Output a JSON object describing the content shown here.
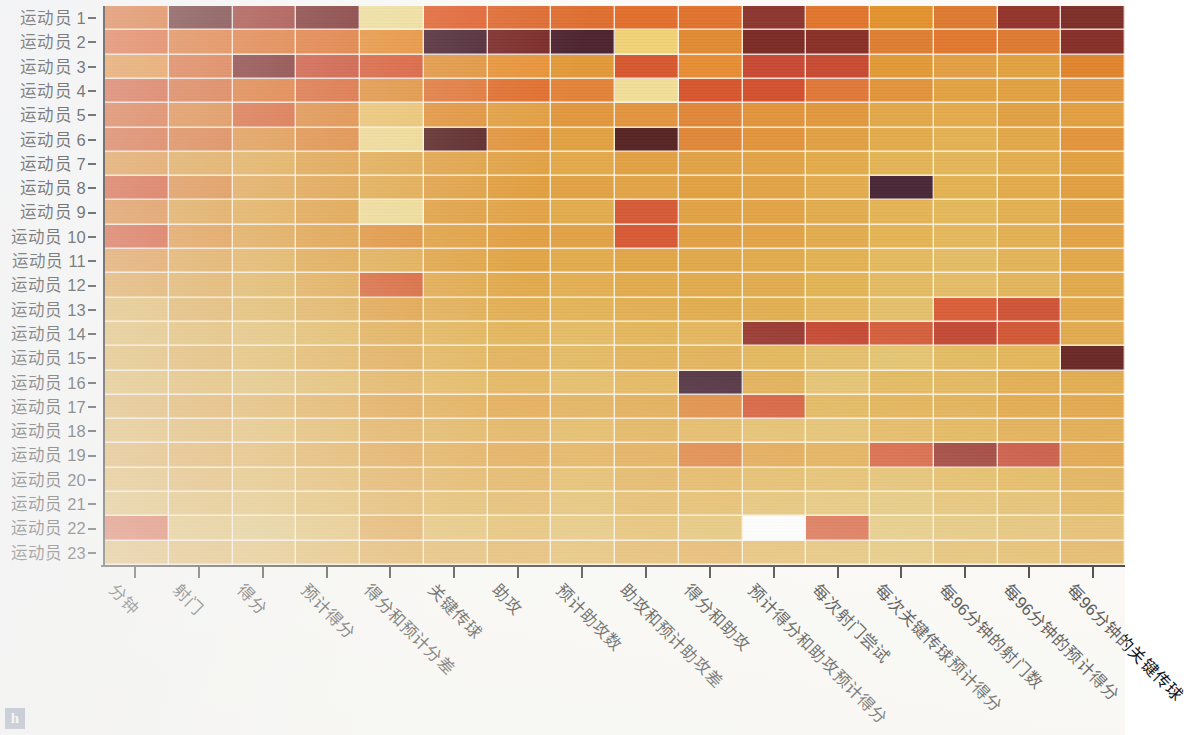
{
  "figure": {
    "panel_label": "h",
    "panel_badge_color": "#3b4a78",
    "background_color": "#fbfaf8",
    "gridline_color": "#fffcf4"
  },
  "chart_data": {
    "type": "heatmap",
    "title": "",
    "xlabel": "",
    "ylabel": "",
    "grid": true,
    "legend": "none",
    "colormap": {
      "name": "YlOrRd-reversed-ish",
      "stops": [
        "#ffffff",
        "#f4e3a0",
        "#eecb72",
        "#e8a84a",
        "#e2923c",
        "#dd7a34",
        "#d95f30",
        "#cf4f36",
        "#b8443a",
        "#8e3530",
        "#6b2a28",
        "#4a2838"
      ],
      "low_label": "low",
      "high_label": "high"
    },
    "categories": [
      "分钟",
      "射门",
      "得分",
      "预计得分",
      "得分和预计分差",
      "关键传球",
      "助攻",
      "预计助攻数",
      "助攻和预计助攻差",
      "得分和助攻",
      "预计得分和助攻预计得分",
      "每次射门尝试",
      "每次关键传球预计得分",
      "每96分钟的射门数",
      "每96分钟的预计得分",
      "每96分钟的关键传球"
    ],
    "rows": [
      "运动员 1",
      "运动员 2",
      "运动员 3",
      "运动员 4",
      "运动员 5",
      "运动员 6",
      "运动员 7",
      "运动员 8",
      "运动员 9",
      "运动员 10",
      "运动员 11",
      "运动员 12",
      "运动员 13",
      "运动员 14",
      "运动员 15",
      "运动员 16",
      "运动员 17",
      "运动员 18",
      "运动员 19",
      "运动员 20",
      "运动员 21",
      "运动员 22",
      "运动员 23"
    ],
    "colors": [
      [
        "#e0702f",
        "#6b2a28",
        "#a03a30",
        "#7a2c29",
        "#f0de98",
        "#e2622f",
        "#df6a30",
        "#df6f31",
        "#e1702f",
        "#e0742f",
        "#8d3730",
        "#e1762f",
        "#e3932f",
        "#dd7b32",
        "#94352d",
        "#7e2f2a"
      ],
      [
        "#e2662f",
        "#e2752f",
        "#e2742f",
        "#e2742f",
        "#e98f33",
        "#4c2430",
        "#7a2a27",
        "#4e2430",
        "#f0d377",
        "#e18a34",
        "#7c2c27",
        "#8a3129",
        "#dd7f33",
        "#e1782f",
        "#dd7b33",
        "#863029"
      ],
      [
        "#e89038",
        "#dd6b33",
        "#7e2c28",
        "#cd4f33",
        "#d95a33",
        "#e2953c",
        "#e89437",
        "#e29a39",
        "#d6592f",
        "#e68e35",
        "#c84a34",
        "#c84b33",
        "#e29a38",
        "#e2a043",
        "#e2a241",
        "#e0852f"
      ],
      [
        "#d95c33",
        "#dc6a33",
        "#e1752f",
        "#dd6833",
        "#e2923c",
        "#e2783a",
        "#e1702f",
        "#e3843a",
        "#f0de98",
        "#d7572f",
        "#d3522f",
        "#e1783a",
        "#e2953c",
        "#e3a244",
        "#e2a243",
        "#e2963d"
      ],
      [
        "#dc6833",
        "#e08136",
        "#db6433",
        "#e1893a",
        "#ecc36e",
        "#e2953c",
        "#e3a043",
        "#e2983f",
        "#e2953e",
        "#e0883a",
        "#e2953c",
        "#e2993f",
        "#e3a84b",
        "#e4aa4d",
        "#e2a145",
        "#e2a042"
      ],
      [
        "#db6533",
        "#dd7536",
        "#e2903c",
        "#e1893a",
        "#f0da92",
        "#5c2726",
        "#e2963e",
        "#e2a244",
        "#592525",
        "#e0883a",
        "#e2953c",
        "#e2a144",
        "#e3ab4c",
        "#e4b255",
        "#e3a84a",
        "#e2953d"
      ],
      [
        "#e2953e",
        "#e2a244",
        "#e3a94b",
        "#e2a144",
        "#e3ab4e",
        "#e2a448",
        "#e2a346",
        "#e3a94b",
        "#e2a245",
        "#e2a347",
        "#e2a448",
        "#e3ab4c",
        "#e4b456",
        "#e4b65b",
        "#e3ae50",
        "#e2a244"
      ],
      [
        "#d9572f",
        "#e0883a",
        "#e3a44a",
        "#e2a145",
        "#e3ab4e",
        "#e2a246",
        "#e2a041",
        "#e2a346",
        "#e2a448",
        "#e2a243",
        "#e2a448",
        "#e4ac4f",
        "#4a2838",
        "#e4b253",
        "#e3ab4c",
        "#e2a041"
      ],
      [
        "#e0883a",
        "#e2a144",
        "#e3a94b",
        "#e2a245",
        "#f0dc96",
        "#e2a246",
        "#e2a448",
        "#e3ac4f",
        "#d55b37",
        "#e2a346",
        "#e2a448",
        "#e3ac50",
        "#e4b557",
        "#e4b85c",
        "#e3b053",
        "#e2a345"
      ],
      [
        "#d9562f",
        "#e2953c",
        "#e2a447",
        "#e2a044",
        "#e2963e",
        "#e2a346",
        "#e2a145",
        "#e2a347",
        "#d65b35",
        "#e2a245",
        "#e2a448",
        "#e3ad50",
        "#e4b556",
        "#e4b85d",
        "#e3b154",
        "#e2a446"
      ],
      [
        "#e2963f",
        "#e2a347",
        "#e3ad50",
        "#e2a648",
        "#e3ae52",
        "#e2a74a",
        "#e2a648",
        "#e3ad50",
        "#e2a74a",
        "#e2a94c",
        "#e2ab4e",
        "#e3b255",
        "#e4b960",
        "#e4bc66",
        "#e3b55b",
        "#e2a84b"
      ],
      [
        "#e2a144",
        "#e2a74a",
        "#e3b053",
        "#e2a94c",
        "#d96537",
        "#e2aa4d",
        "#e2a94b",
        "#e3af53",
        "#e2ab4e",
        "#e2ab4e",
        "#e2ad51",
        "#e3b457",
        "#e4bb63",
        "#e4bd68",
        "#e3b65d",
        "#e2aa4d"
      ],
      [
        "#e4b65c",
        "#e2ac50",
        "#e3b457",
        "#e2ae52",
        "#e2a245",
        "#e2ad51",
        "#e2ac4f",
        "#e3b255",
        "#e2ae51",
        "#e2ad50",
        "#e2b054",
        "#e4b85f",
        "#e4c06c",
        "#d9603a",
        "#cf5538",
        "#e2a84c"
      ],
      [
        "#e4b95f",
        "#e3b458",
        "#e4bb63",
        "#e3b659",
        "#e2ab4e",
        "#e3b355",
        "#e3b254",
        "#e4b85e",
        "#e3b456",
        "#e4b55a",
        "#9a3a32",
        "#c64b36",
        "#d5603d",
        "#c24b37",
        "#d25939",
        "#e2ab50"
      ],
      [
        "#e3b254",
        "#e2ad51",
        "#e3b659",
        "#e3b054",
        "#e2a84c",
        "#e3b255",
        "#e2ae52",
        "#e3b65a",
        "#e2b053",
        "#e2b055",
        "#e3b659",
        "#e4be69",
        "#e4c471",
        "#e3bb63",
        "#e3b75d",
        "#6b2a28"
      ],
      [
        "#e3b658",
        "#e3b254",
        "#e3ba62",
        "#e3b65c",
        "#e2ad51",
        "#e3b558",
        "#e3b153",
        "#e3b95f",
        "#e3b457",
        "#4a2838",
        "#e2ae52",
        "#e4c16e",
        "#e3b95f",
        "#e3b75e",
        "#e2ae52",
        "#e2ad51"
      ],
      [
        "#e2ab4f",
        "#e2a74a",
        "#e3ae52",
        "#e2aa4d",
        "#e2a245",
        "#e2a94c",
        "#e2a648",
        "#e2ad51",
        "#e2a94c",
        "#e0893c",
        "#d55a36",
        "#e3b65a",
        "#e3b254",
        "#e2b055",
        "#e2a94c",
        "#e2a74a"
      ],
      [
        "#e3b255",
        "#e2ae52",
        "#e4b65c",
        "#e3b154",
        "#e2a94c",
        "#e2b055",
        "#e2ad51",
        "#e3b65a",
        "#e2b053",
        "#e3b65c",
        "#e4bc66",
        "#e4bf6a",
        "#e4b75e",
        "#e3b558",
        "#e2ae52",
        "#e2ab4e"
      ],
      [
        "#e2a94c",
        "#e2a648",
        "#e3ae52",
        "#e2a94c",
        "#e2a144",
        "#e2a84b",
        "#e2a446",
        "#e3ab4e",
        "#e2a74a",
        "#df7f38",
        "#e2a346",
        "#e2ab4e",
        "#d65f3a",
        "#9c3a32",
        "#c8513a",
        "#e2a346"
      ],
      [
        "#e3b053",
        "#e2ad51",
        "#e4b559",
        "#e3b053",
        "#e2a84c",
        "#e2ae52",
        "#e2ab4e",
        "#e3b558",
        "#e2ad51",
        "#e3b053",
        "#e3b65b",
        "#e4ba62",
        "#e4bd68",
        "#e3b95f",
        "#e3b659",
        "#e2ae52"
      ],
      [
        "#e3b659",
        "#e3b255",
        "#e4b95f",
        "#e3b558",
        "#e2ad51",
        "#e3b457",
        "#e2b053",
        "#e3b95e",
        "#e3b255",
        "#e3b558",
        "#e4bc65",
        "#e4c06c",
        "#e4c371",
        "#e4be68",
        "#e3bb63",
        "#e2b255"
      ],
      [
        "#d9562f",
        "#e4b95f",
        "#e4c06c",
        "#e4bb63",
        "#e2a347",
        "#e4ba62",
        "#e3b557",
        "#e4bc64",
        "#e3b659",
        "#e3bb62",
        "#ffffff",
        "#d85f3a",
        "#e4c573",
        "#e4c16e",
        "#e4bd68",
        "#e3b75f"
      ],
      [
        "#e3b054",
        "#e2ae52",
        "#e4b75e",
        "#e3b255",
        "#e2a94c",
        "#e2b055",
        "#e2ac50",
        "#e3b659",
        "#e2ae52",
        "#e2ab4e",
        "#e4b75e",
        "#e4bb64",
        "#e4c06b",
        "#e3b95f",
        "#e3b65b",
        "#e2ae52"
      ]
    ]
  }
}
